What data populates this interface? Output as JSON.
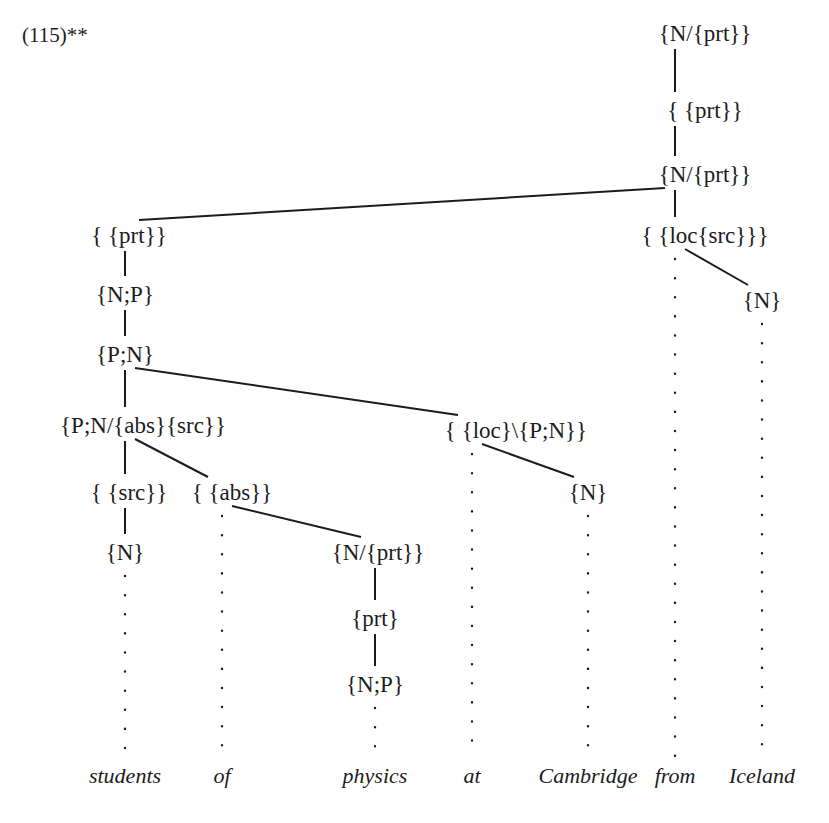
{
  "figure": {
    "example_number": "(115)**",
    "caption_words": [
      "students",
      "of",
      "physics",
      "at",
      "Cambridge",
      "from",
      "Iceland"
    ]
  },
  "columns": [
    {
      "id": "students",
      "word": "students",
      "x": 125
    },
    {
      "id": "of",
      "word": "of",
      "x": 222
    },
    {
      "id": "physics",
      "word": "physics",
      "x": 375
    },
    {
      "id": "at",
      "word": "at",
      "x": 472
    },
    {
      "id": "cambridge",
      "word": "Cambridge",
      "x": 588
    },
    {
      "id": "from",
      "word": "from",
      "x": 675
    },
    {
      "id": "iceland",
      "word": "Iceland",
      "x": 762
    }
  ],
  "nodes": [
    {
      "id": "n1",
      "label": "{N/{prt}}",
      "column": "from",
      "x": 705,
      "y": 33
    },
    {
      "id": "n2",
      "label": "{ {prt}}",
      "column": "from",
      "x": 705,
      "y": 110
    },
    {
      "id": "n3",
      "label": "{N/{prt}}",
      "column": "from",
      "x": 705,
      "y": 174
    },
    {
      "id": "n4",
      "label": "{ {loc{src}}}",
      "column": "from",
      "x": 705,
      "y": 235
    },
    {
      "id": "n5",
      "label": "{N}",
      "column": "iceland",
      "x": 762,
      "y": 300
    },
    {
      "id": "n6",
      "label": "{ {prt}}",
      "column": "students",
      "x": 129,
      "y": 235
    },
    {
      "id": "n7",
      "label": "{N;P}",
      "column": "students",
      "x": 125,
      "y": 294
    },
    {
      "id": "n8",
      "label": "{P;N}",
      "column": "students",
      "x": 125,
      "y": 354
    },
    {
      "id": "n9",
      "label": "{P;N/{abs}{src}}",
      "column": "students",
      "x": 143,
      "y": 425
    },
    {
      "id": "n10",
      "label": "{ {src}}",
      "column": "students",
      "x": 129,
      "y": 492
    },
    {
      "id": "n11",
      "label": "{ {abs}}",
      "column": "of",
      "x": 232,
      "y": 492
    },
    {
      "id": "n12",
      "label": "{N}",
      "column": "students",
      "x": 125,
      "y": 552
    },
    {
      "id": "n13",
      "label": "{N/{prt}}",
      "column": "physics",
      "x": 378,
      "y": 552
    },
    {
      "id": "n14",
      "label": "{prt}",
      "column": "physics",
      "x": 375,
      "y": 618
    },
    {
      "id": "n15",
      "label": "{N;P}",
      "column": "physics",
      "x": 375,
      "y": 684
    },
    {
      "id": "n16",
      "label": "{ {loc}\\{P;N}}",
      "column": "at",
      "x": 516,
      "y": 430
    },
    {
      "id": "n17",
      "label": "{N}",
      "column": "cambridge",
      "x": 588,
      "y": 492
    }
  ],
  "edges": [
    {
      "from": "n1",
      "to": "n2",
      "kind": "vertical"
    },
    {
      "from": "n2",
      "to": "n3",
      "kind": "vertical"
    },
    {
      "from": "n3",
      "to": "n4",
      "kind": "vertical"
    },
    {
      "from": "n4",
      "to": "n5",
      "kind": "diagonal"
    },
    {
      "from": "n3",
      "to": "n6",
      "kind": "diagonal"
    },
    {
      "from": "n6",
      "to": "n7",
      "kind": "vertical"
    },
    {
      "from": "n7",
      "to": "n8",
      "kind": "vertical"
    },
    {
      "from": "n8",
      "to": "n9",
      "kind": "vertical"
    },
    {
      "from": "n8",
      "to": "n16",
      "kind": "diagonal"
    },
    {
      "from": "n9",
      "to": "n10",
      "kind": "vertical"
    },
    {
      "from": "n9",
      "to": "n11",
      "kind": "diagonal"
    },
    {
      "from": "n10",
      "to": "n12",
      "kind": "vertical"
    },
    {
      "from": "n11",
      "to": "n13",
      "kind": "diagonal"
    },
    {
      "from": "n13",
      "to": "n14",
      "kind": "vertical"
    },
    {
      "from": "n14",
      "to": "n15",
      "kind": "vertical"
    },
    {
      "from": "n16",
      "to": "n17",
      "kind": "diagonal"
    }
  ],
  "colors": {
    "ink": "#1c1c1c",
    "background": "#ffffff"
  }
}
